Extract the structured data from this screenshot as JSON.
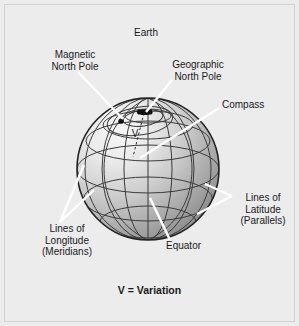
{
  "figure": {
    "background_color": "#ececec",
    "border_color": "#d2d2d2",
    "text_color": "#1a1a1a",
    "leader_line_color": "#ffffff",
    "grid_line_color": "#3b3b3b",
    "globe_outline_color": "#222222"
  },
  "labels": {
    "earth": "Earth",
    "magnetic_north_pole": {
      "line1": "Magnetic",
      "line2": "North Pole"
    },
    "geographic_north_pole": {
      "line1": "Geographic",
      "line2": "North Pole"
    },
    "compass": "Compass",
    "lines_of_latitude": {
      "line1": "Lines of",
      "line2": "Latitude",
      "line3": "(Parallels)"
    },
    "lines_of_longitude": {
      "line1": "Lines of",
      "line2": "Longitude",
      "line3": "(Meridians)"
    },
    "equator": "Equator",
    "variation_legend": "V = Variation",
    "variation_symbol": "V"
  },
  "globe": {
    "center_x": 148,
    "center_y": 169,
    "radius": 71,
    "meridian_count": 7,
    "parallel_count": 5,
    "geographic_pole_marker": "square-marker",
    "magnetic_pole_marker": "dot-marker"
  }
}
